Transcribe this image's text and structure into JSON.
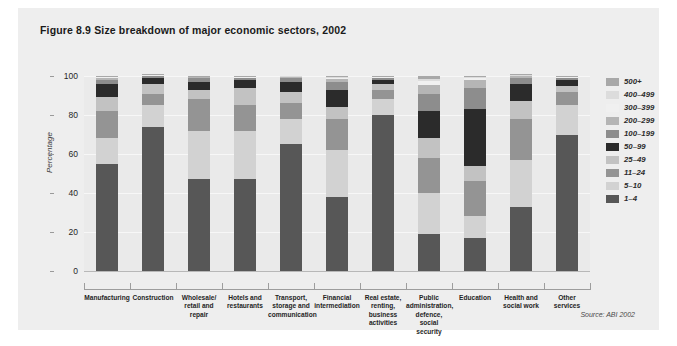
{
  "figure": {
    "title": "Figure 8.9  Size breakdown of major economic sectors, 2002",
    "source": "Source: ABI 2002"
  },
  "chart_data": {
    "type": "bar",
    "stacked": true,
    "normalized": true,
    "title": "Figure 8.9  Size breakdown of major economic sectors, 2002",
    "xlabel": "",
    "ylabel": "Percentage",
    "ylim": [
      0,
      100
    ],
    "yticks": [
      0,
      20,
      40,
      60,
      80,
      100
    ],
    "grid": true,
    "legend_position": "right",
    "categories": [
      "Manufacturing",
      "Construction",
      "Wholesale/ retail and repair",
      "Hotels and restaurants",
      "Transport, storage and communication",
      "Financial intermediation",
      "Real estate, renting, business activities",
      "Public administration, defence, social security",
      "Education",
      "Health and social work",
      "Other services"
    ],
    "category_lines": [
      [
        "Manufacturing"
      ],
      [
        "Construction"
      ],
      [
        "Wholesale/",
        "retail and",
        "repair"
      ],
      [
        "Hotels and",
        "restaurants"
      ],
      [
        "Transport,",
        "storage and",
        "communication"
      ],
      [
        "Financial",
        "intermediation"
      ],
      [
        "Real estate,",
        "renting,",
        "business",
        "activities"
      ],
      [
        "Public",
        "administration,",
        "defence, social",
        "security"
      ],
      [
        "Education"
      ],
      [
        "Health and",
        "social work"
      ],
      [
        "Other",
        "services"
      ]
    ],
    "series": [
      {
        "name": "1–4",
        "color": "#575757",
        "values": [
          55,
          74,
          47,
          47,
          65,
          38,
          80,
          19,
          17,
          33,
          70
        ]
      },
      {
        "name": "5–10",
        "color": "#d2d2d2",
        "values": [
          13,
          11,
          25,
          25,
          13,
          24,
          8,
          21,
          11,
          24,
          15
        ]
      },
      {
        "name": "11–24",
        "color": "#949494",
        "values": [
          14,
          6,
          16,
          13,
          8,
          16,
          5,
          18,
          18,
          21,
          7
        ]
      },
      {
        "name": "25–49",
        "color": "#c2c2c2",
        "values": [
          7,
          5,
          5,
          9,
          6,
          6,
          3,
          10,
          8,
          9,
          3
        ]
      },
      {
        "name": "50–99",
        "color": "#2b2b2b",
        "values": [
          7,
          3,
          4,
          4,
          5,
          9,
          2,
          14,
          29,
          9,
          3
        ]
      },
      {
        "name": "100–199",
        "color": "#8d8d8d",
        "values": [
          2,
          1,
          2,
          1,
          2,
          4,
          1,
          9,
          11,
          3,
          1
        ]
      },
      {
        "name": "200–299",
        "color": "#b5b5b5",
        "values": [
          1,
          0.4,
          0.6,
          0.5,
          0.7,
          1.5,
          0.5,
          4.5,
          4,
          1,
          0.5
        ]
      },
      {
        "name": "300–399",
        "color": "#f0f0f0",
        "values": [
          0.5,
          0.2,
          0.2,
          0.2,
          0.2,
          0.6,
          0.2,
          2.0,
          1.2,
          0.4,
          0.2
        ]
      },
      {
        "name": "400–499",
        "color": "#dcdcdc",
        "values": [
          0.3,
          0.2,
          0.1,
          0.2,
          0.1,
          0.5,
          0.2,
          1.0,
          0.6,
          0.3,
          0.2
        ]
      },
      {
        "name": "500+",
        "color": "#a8a8a8",
        "values": [
          0.2,
          0.2,
          0.1,
          0.1,
          0.0,
          0.4,
          0.1,
          1.5,
          0.2,
          0.3,
          0.1
        ]
      }
    ],
    "legend_order": [
      "500+",
      "400–499",
      "300–399",
      "200–299",
      "100–199",
      "50–99",
      "25–49",
      "11–24",
      "5–10",
      "1–4"
    ]
  }
}
